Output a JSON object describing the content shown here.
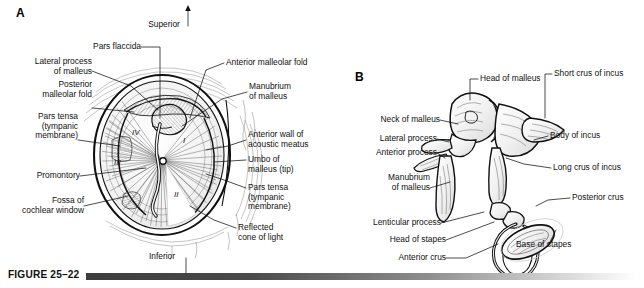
{
  "figure": {
    "caption_label": "FIGURE 25–22",
    "panel_a": "A",
    "panel_b": "B"
  },
  "orientation": {
    "superior": "Superior",
    "inferior": "Inferior"
  },
  "panel_a_labels": {
    "pars_flaccida": "Pars flaccida",
    "lateral_process": "Lateral process\nof malleus",
    "posterior_fold": "Posterior\nmalleolar fold",
    "pars_tensa_left": "Pars tensa\n(tympanic\nmembrane)",
    "promontory": "Promontory",
    "fossa": "Fossa of\ncochlear window",
    "anterior_malleolar_fold": "Anterior malleolar fold",
    "manubrium": "Manubrium\nof malleus",
    "anterior_wall": "Anterior wall of\nacoustic meatus",
    "umbo": "Umbo of\nmalleus (tip)",
    "pars_tensa_right": "Pars tensa\n(tympanic\nmembrane)",
    "reflected_cone": "Reflected\ncone of light"
  },
  "quadrants": [
    "I",
    "II",
    "III",
    "IV"
  ],
  "panel_b_labels": {
    "neck_of_malleus": "Neck of malleus",
    "lateral_process": "Lateral process",
    "anterior_process": "Anterior process",
    "manubrium": "Manubrium\nof malleus",
    "lenticular_process": "Lenticular process",
    "head_of_stapes": "Head of stapes",
    "anterior_crus": "Anterior crus",
    "head_of_malleus": "Head of malleus",
    "short_crus": "Short crus of incus",
    "body_of_incus": "Body of incus",
    "long_crus": "Long crus of incus",
    "posterior_crus": "Posterior crus",
    "base_of_stapes": "Base of stapes"
  },
  "colors": {
    "ink": "#111111",
    "bar_dark": "#3d3d3d",
    "background": "#ffffff"
  }
}
